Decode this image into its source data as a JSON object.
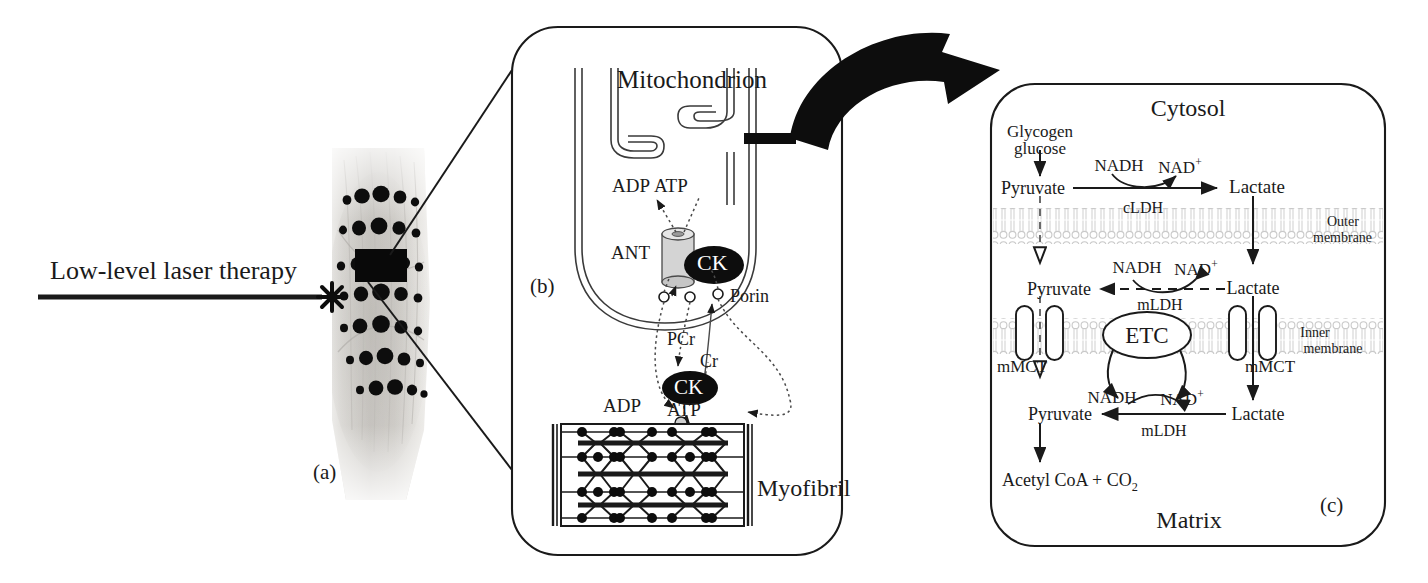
{
  "figure": {
    "domain": "biology-diagram",
    "background": "#ffffff",
    "ink": "#1a1a1a",
    "membrane_color": "#c9c9c9",
    "panels": [
      {
        "id": "a",
        "tag": "(a)"
      },
      {
        "id": "b",
        "tag": "(b)"
      },
      {
        "id": "c",
        "tag": "(c)"
      }
    ]
  },
  "panel_a": {
    "tag": "(a)",
    "therapy_label": "Low-level laser therapy",
    "beam": "horizontal-arrow",
    "impact": "star-burst",
    "image_caption": "calf muscle photograph with laser treatment dot grid",
    "treatment_site": "black rectangle patch"
  },
  "panel_b": {
    "tag": "(b)",
    "title": "Mitochondrion",
    "myofibril_label": "Myofibril",
    "labels": {
      "adp_top": "ADP",
      "atp_top": "ATP",
      "ant": "ANT",
      "ck_outer": "CK",
      "porin": "Porin",
      "pcr": "PCr",
      "cr": "Cr",
      "ck_myo": "CK",
      "adp_bottom": "ADP",
      "atp_bottom": "ATP"
    }
  },
  "panel_c": {
    "tag": "(c)",
    "compartments": {
      "cytosol": "Cytosol",
      "matrix": "Matrix",
      "outer_membrane_line1": "Outer",
      "outer_membrane_line2": "membrane",
      "inner_membrane_line1": "Inner",
      "inner_membrane_line2": "membrane"
    },
    "cytosol": {
      "substrate_line1": "Glycogen",
      "substrate_line2": "glucose",
      "pyruvate": "Pyruvate",
      "lactate": "Lactate",
      "nadh": "NADH",
      "nad_base": "NAD",
      "nad_charge": "+",
      "enzyme": "cLDH"
    },
    "intermembrane": {
      "pyruvate": "Pyruvate",
      "lactate": "Lactate",
      "nadh": "NADH",
      "nad_base": "NAD",
      "nad_charge": "+",
      "enzyme": "mLDH"
    },
    "inner_membrane": {
      "etc": "ETC",
      "mmct_left": "mMCT",
      "mmct_right": "mMCT",
      "nadh": "NADH",
      "nad_base": "NAD",
      "nad_charge": "+"
    },
    "matrix": {
      "pyruvate": "Pyruvate",
      "lactate": "Lactate",
      "nadh": "NADH",
      "nad_base": "NAD",
      "nad_charge": "+",
      "enzyme": "mLDH",
      "product_base": "Acetyl CoA + CO",
      "product_sub": "2"
    }
  }
}
